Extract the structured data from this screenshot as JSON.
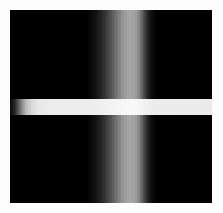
{
  "figure": {
    "kind": "grayscale-intensity-image",
    "width_px": 223,
    "height_px": 213,
    "background_color": "#fdfdfd",
    "field": {
      "left_px": 10,
      "top_px": 10,
      "width_px": 202,
      "height_px": 193,
      "background_color": "#000000",
      "description": "black intensity field"
    }
  },
  "chart_data": {
    "type": "heatmap",
    "title": "",
    "subtitle": "",
    "xlabel": "",
    "ylabel": "",
    "grid": false,
    "legend": false,
    "colormap": "grayscale",
    "value_range": [
      0,
      1
    ],
    "xlim": [
      0,
      202
    ],
    "ylim": [
      0,
      193
    ],
    "features": [
      {
        "name": "vertical-band",
        "orientation": "vertical",
        "center_px": 110,
        "peak_intensity": 0.66,
        "profile": "asymmetric-gaussian",
        "stops": [
          {
            "pos_pct": 0,
            "intensity": 0.0
          },
          {
            "pos_pct": 38,
            "intensity": 0.0
          },
          {
            "pos_pct": 42,
            "intensity": 0.06
          },
          {
            "pos_pct": 46,
            "intensity": 0.17
          },
          {
            "pos_pct": 50,
            "intensity": 0.33
          },
          {
            "pos_pct": 53,
            "intensity": 0.47
          },
          {
            "pos_pct": 56,
            "intensity": 0.6
          },
          {
            "pos_pct": 59,
            "intensity": 0.66
          },
          {
            "pos_pct": 62,
            "intensity": 0.63
          },
          {
            "pos_pct": 64,
            "intensity": 0.52
          },
          {
            "pos_pct": 66,
            "intensity": 0.33
          },
          {
            "pos_pct": 68,
            "intensity": 0.16
          },
          {
            "pos_pct": 70,
            "intensity": 0.05
          },
          {
            "pos_pct": 73,
            "intensity": 0.0
          },
          {
            "pos_pct": 100,
            "intensity": 0.0
          }
        ]
      },
      {
        "name": "horizontal-band",
        "orientation": "horizontal",
        "top_px": 89,
        "height_px": 16,
        "peak_intensity": 0.93,
        "profile": "flat-top-with-left-ramp",
        "stops": [
          {
            "pos_pct": 0,
            "intensity": 0.04
          },
          {
            "pos_pct": 2,
            "intensity": 0.12
          },
          {
            "pos_pct": 4,
            "intensity": 0.33
          },
          {
            "pos_pct": 6,
            "intensity": 0.56
          },
          {
            "pos_pct": 8,
            "intensity": 0.74
          },
          {
            "pos_pct": 11,
            "intensity": 0.86
          },
          {
            "pos_pct": 14,
            "intensity": 0.91
          },
          {
            "pos_pct": 20,
            "intensity": 0.93
          },
          {
            "pos_pct": 60,
            "intensity": 0.93
          },
          {
            "pos_pct": 100,
            "intensity": 0.92
          }
        ]
      },
      {
        "name": "band-intersection",
        "center_x_px": 110,
        "center_y_px": 97,
        "intensity": 1.0,
        "description": "bands sum to saturated white where they cross"
      }
    ]
  }
}
